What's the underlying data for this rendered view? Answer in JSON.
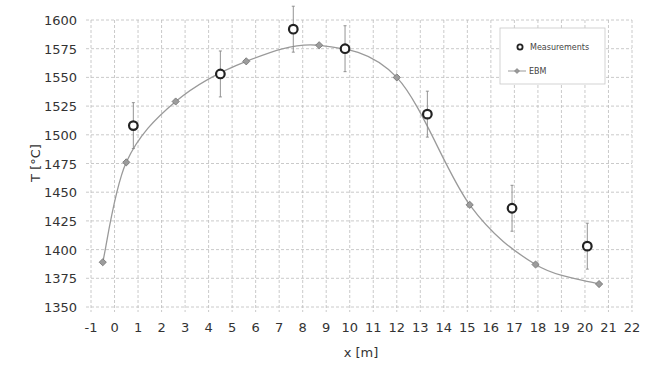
{
  "chart_data": {
    "type": "scatter",
    "title": "",
    "xlabel": "x [m]",
    "ylabel": "T [°C]",
    "xlim": [
      -1,
      22
    ],
    "ylim": [
      1350,
      1600
    ],
    "x_ticks": [
      -1,
      0,
      1,
      2,
      3,
      4,
      5,
      6,
      7,
      8,
      9,
      10,
      11,
      12,
      13,
      14,
      15,
      16,
      17,
      18,
      19,
      20,
      21,
      22
    ],
    "y_ticks": [
      1350,
      1375,
      1400,
      1425,
      1450,
      1475,
      1500,
      1525,
      1550,
      1575,
      1600
    ],
    "grid": true,
    "legend_position": "top-right",
    "series": [
      {
        "name": "Measurements",
        "type": "scatter",
        "marker": "open-circle",
        "color": "#222222",
        "x": [
          0.8,
          4.5,
          7.6,
          9.8,
          13.3,
          16.9,
          20.1
        ],
        "y": [
          1508,
          1553,
          1592,
          1575,
          1518,
          1436,
          1403
        ],
        "error": [
          20,
          20,
          20,
          20,
          20,
          20,
          20
        ]
      },
      {
        "name": "EBM",
        "type": "line",
        "marker": "diamond",
        "color": "#9a9a9a",
        "x": [
          -0.5,
          0.5,
          2.6,
          5.6,
          8.7,
          12.0,
          15.1,
          17.9,
          20.6
        ],
        "y": [
          1389,
          1476,
          1529,
          1564,
          1578,
          1550,
          1439,
          1387,
          1370
        ]
      }
    ]
  },
  "legend": {
    "items": [
      {
        "label": "Measurements"
      },
      {
        "label": "EBM"
      }
    ]
  }
}
